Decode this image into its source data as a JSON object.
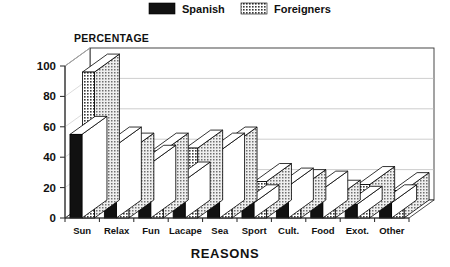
{
  "legend": {
    "position": "top-center",
    "items": [
      {
        "label": "Spanish",
        "swatch": "solid-black",
        "color": "#111111"
      },
      {
        "label": "Foreigners",
        "swatch": "crosshatch",
        "color": "#8a8a8a"
      }
    ]
  },
  "axis": {
    "y_title": "PERCENTAGE",
    "x_title": "REASONS"
  },
  "chart_data": {
    "type": "bar",
    "title": "",
    "subtitle": "",
    "xlabel": "REASONS",
    "ylabel": "PERCENTAGE",
    "ylim": [
      0,
      100
    ],
    "yticks": [
      0,
      20,
      40,
      60,
      80,
      100
    ],
    "ytick_labels": [
      "0",
      "20",
      "40",
      "60",
      "80",
      "100"
    ],
    "grid": true,
    "legend_position": "top-center",
    "style": "3d-isometric-grouped-bar",
    "categories": [
      "Sun",
      "Relax",
      "Fun",
      "Lacape",
      "Sea",
      "Sport",
      "Cult.",
      "Food",
      "Exot.",
      "Other"
    ],
    "series": [
      {
        "name": "Spanish",
        "fill": "solid-black",
        "values": [
          55,
          48,
          36,
          25,
          44,
          10,
          21,
          19,
          9,
          10
        ]
      },
      {
        "name": "Foreigners",
        "fill": "crosshatch",
        "values": [
          96,
          44,
          44,
          46,
          48,
          24,
          20,
          13,
          22,
          18
        ]
      }
    ]
  }
}
